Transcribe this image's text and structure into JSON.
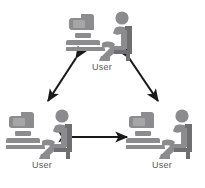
{
  "diagram": {
    "background_color": "#ffffff",
    "figure_color": "#8c8c8e",
    "figure_shade_color": "#6f6f71",
    "label_color": "#58585a",
    "arrow_color": "#1a1a1a",
    "nodes": [
      {
        "id": "top",
        "label": "User",
        "icon": "user-at-computer-icon",
        "position": "top-center"
      },
      {
        "id": "left",
        "label": "User",
        "icon": "user-at-computer-icon",
        "position": "bottom-left"
      },
      {
        "id": "right",
        "label": "User",
        "icon": "user-at-computer-icon",
        "position": "bottom-right"
      }
    ],
    "connections": [
      {
        "id": "top-left",
        "from": "top",
        "to": "left",
        "style": "double-headed-arrow"
      },
      {
        "id": "top-right",
        "from": "top",
        "to": "right",
        "style": "double-headed-arrow"
      },
      {
        "id": "left-right",
        "from": "left",
        "to": "right",
        "style": "double-headed-arrow"
      }
    ]
  }
}
